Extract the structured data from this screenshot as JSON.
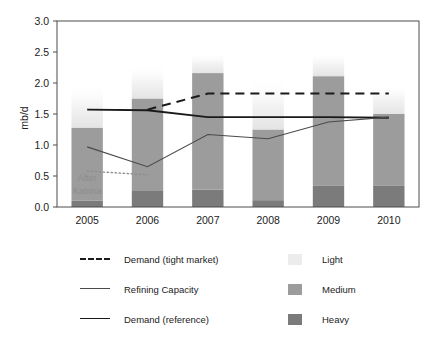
{
  "chart_data": {
    "type": "bar",
    "title": "",
    "subtitle": "",
    "xlabel": "",
    "ylabel": "mb/d",
    "categories": [
      "2005",
      "2006",
      "2007",
      "2008",
      "2009",
      "2010"
    ],
    "ylim": [
      0.0,
      3.0
    ],
    "ytick_values": [
      0.0,
      0.5,
      1.0,
      1.5,
      2.0,
      2.5,
      3.0
    ],
    "ytick_labels": [
      "0.0",
      "0.5",
      "1.0",
      "1.5",
      "2.0",
      "2.5",
      "3.0"
    ],
    "grid": false,
    "legend_position": "below",
    "stacked": true,
    "series": [
      {
        "name": "Heavy",
        "kind": "bar",
        "color": "#7b7b7b",
        "values": [
          0.1,
          0.27,
          0.28,
          0.11,
          0.34,
          0.34
        ]
      },
      {
        "name": "Medium",
        "kind": "bar",
        "color": "#9c9c9c",
        "values": [
          1.18,
          1.48,
          1.88,
          1.14,
          1.77,
          1.16
        ]
      },
      {
        "name": "Light",
        "kind": "bar",
        "color": "#ededed",
        "values": [
          0.72,
          0.55,
          0.34,
          0.85,
          0.39,
          0.5
        ]
      },
      {
        "name": "Demand (tight market)",
        "kind": "line",
        "style": "dashed",
        "color": "#1a1a1a",
        "width": 2.0,
        "x": [
          "2006",
          "2007",
          "2008",
          "2009",
          "2010"
        ],
        "values": [
          1.57,
          1.83,
          1.83,
          1.83,
          1.83
        ]
      },
      {
        "name": "Demand (reference)",
        "kind": "line",
        "style": "solid",
        "color": "#1a1a1a",
        "width": 1.9,
        "x": [
          "2005",
          "2006",
          "2007",
          "2008",
          "2009",
          "2010"
        ],
        "values": [
          1.57,
          1.56,
          1.45,
          1.45,
          1.45,
          1.44
        ]
      },
      {
        "name": "Refining Capacity",
        "kind": "line",
        "style": "solid",
        "color": "#4a4a4a",
        "width": 1.1,
        "x": [
          "2005",
          "2006",
          "2007",
          "2008",
          "2009",
          "2010"
        ],
        "values": [
          0.97,
          0.65,
          1.17,
          1.1,
          1.37,
          1.45
        ]
      },
      {
        "name": "After Katrina",
        "kind": "line",
        "style": "dotted",
        "color": "#8d8d8d",
        "width": 1.3,
        "x": [
          "2005",
          "2006"
        ],
        "values": [
          0.58,
          0.52
        ]
      }
    ],
    "annotations": [
      {
        "text_line1": "After",
        "text_line2": "Katrina",
        "x": "2005",
        "y": 0.42,
        "color": "#8d8d8d"
      }
    ],
    "totals": [
      2.0,
      2.3,
      2.5,
      2.1,
      2.5,
      2.0
    ]
  },
  "axis": {
    "y_label": "mb/d"
  },
  "legend": {
    "lines": [
      {
        "label": "Demand (tight market)",
        "style": "dashed",
        "color": "#1a1a1a"
      },
      {
        "label": "Refining Capacity",
        "style": "solid-thin",
        "color": "#4a4a4a"
      },
      {
        "label": "Demand (reference)",
        "style": "solid-thick",
        "color": "#1a1a1a"
      }
    ],
    "swatches": [
      {
        "label": "Light",
        "color": "#ececec"
      },
      {
        "label": "Medium",
        "color": "#9c9c9c"
      },
      {
        "label": "Heavy",
        "color": "#7b7b7b"
      }
    ]
  },
  "annotation": {
    "line1": "After",
    "line2": "Katrina"
  }
}
